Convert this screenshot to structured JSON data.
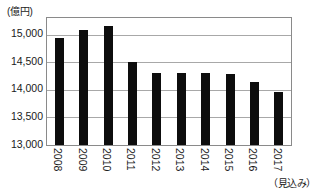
{
  "chart_data": {
    "type": "bar",
    "title": "",
    "subtitle": "",
    "unit_label": "(億円)",
    "xlabel": "",
    "ylabel": "",
    "estimate_note": "（見込み）",
    "categories": [
      "2008",
      "2009",
      "2010",
      "2011",
      "2012",
      "2013",
      "2014",
      "2015",
      "2016",
      "2017"
    ],
    "values": [
      14930,
      15080,
      15150,
      14500,
      14310,
      14310,
      14300,
      14280,
      14150,
      13960
    ],
    "ylim": [
      13000,
      15300
    ],
    "yticks": [
      13000,
      13500,
      14000,
      14500,
      15000
    ],
    "ytick_labels": [
      "13,000",
      "13,500",
      "14,000",
      "14,500",
      "15,000"
    ],
    "grid": true,
    "legend": "none",
    "bar_color": "#0d0d0d",
    "grid_color": "#a8a8a8",
    "axis_color": "#8a8a8a"
  }
}
